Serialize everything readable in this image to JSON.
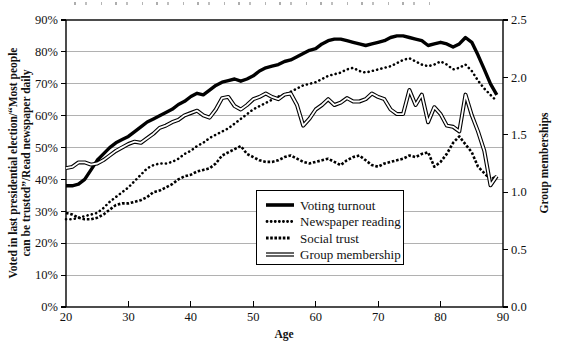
{
  "figure": {
    "x_axis_label": "Age",
    "y_left_axis_label_line1": "Voted in last presidential election/“Most people",
    "y_left_axis_label_line2": "can be trusted”/Read newspaper daily",
    "y_right_axis_label": "Group memberships",
    "colors": {
      "line": "#000000",
      "grid": "#a8a8a8",
      "background": "#ffffff"
    }
  },
  "chart_data": {
    "type": "line",
    "xlabel": "Age",
    "x_range": [
      20,
      90
    ],
    "x_tick_labels": [
      "20",
      "30",
      "40",
      "50",
      "60",
      "70",
      "80",
      "90"
    ],
    "x_tick_values": [
      20,
      30,
      40,
      50,
      60,
      70,
      80,
      90
    ],
    "y_left": {
      "label": "Voted in last presidential election/“Most people can be trusted”/Read newspaper daily",
      "range": [
        0,
        90
      ],
      "tick_labels": [
        "0%",
        "10%",
        "20%",
        "30%",
        "40%",
        "50%",
        "60%",
        "70%",
        "80%",
        "90%"
      ],
      "tick_values": [
        0,
        10,
        20,
        30,
        40,
        50,
        60,
        70,
        80,
        90
      ]
    },
    "y_right": {
      "label": "Group memberships",
      "range": [
        0,
        2.5
      ],
      "tick_labels": [
        "0.0",
        "0.5",
        "1.0",
        "1.5",
        "2.0",
        "2.5"
      ],
      "tick_values": [
        0,
        0.5,
        1,
        1.5,
        2,
        2.5
      ]
    },
    "grid": "horizontal",
    "legend_position": "inside lower-center",
    "ages": [
      20,
      21,
      22,
      23,
      24,
      25,
      26,
      27,
      28,
      29,
      30,
      31,
      32,
      33,
      34,
      35,
      36,
      37,
      38,
      39,
      40,
      41,
      42,
      43,
      44,
      45,
      46,
      47,
      48,
      49,
      50,
      51,
      52,
      53,
      54,
      55,
      56,
      57,
      58,
      59,
      60,
      61,
      62,
      63,
      64,
      65,
      66,
      67,
      68,
      69,
      70,
      71,
      72,
      73,
      74,
      75,
      76,
      77,
      78,
      79,
      80,
      81,
      82,
      83,
      84,
      85,
      86,
      87,
      88,
      89
    ],
    "series": [
      {
        "name": "Voting turnout",
        "axis": "left",
        "unit": "%",
        "style": "solid-thick",
        "values": [
          38,
          38,
          38.5,
          40,
          43,
          46,
          48,
          50,
          51.5,
          52.5,
          53.5,
          55,
          56.5,
          58,
          59,
          60,
          61,
          62,
          63.5,
          64.5,
          66,
          67,
          66.5,
          68,
          69.5,
          70.5,
          71,
          71.5,
          70.8,
          71.5,
          72.5,
          74,
          75,
          75.5,
          76,
          77,
          77.5,
          78.5,
          79.5,
          80.5,
          81,
          82.5,
          83.5,
          84,
          84,
          83.5,
          83,
          82.5,
          82,
          82.5,
          83,
          83.5,
          84.5,
          85,
          85,
          84.5,
          84,
          83.5,
          82,
          82.5,
          83,
          82.5,
          81.5,
          82.5,
          84.5,
          83,
          79,
          74.5,
          70,
          66.5
        ]
      },
      {
        "name": "Newspaper reading",
        "axis": "left",
        "unit": "%",
        "style": "dotted",
        "values": [
          27.5,
          27.5,
          28,
          28.5,
          29,
          29.5,
          31,
          33,
          34.5,
          36,
          37.5,
          39.5,
          41.5,
          43.5,
          44.5,
          45,
          45,
          45.5,
          46.5,
          48,
          49,
          50.5,
          51.5,
          53,
          54,
          55,
          56,
          57.5,
          59,
          60.5,
          62,
          63,
          64,
          65,
          66,
          66.5,
          67.5,
          68.5,
          69.5,
          70,
          70.5,
          71.5,
          72.5,
          73,
          73.5,
          74.5,
          75,
          74,
          73.5,
          74,
          74.5,
          75,
          75.5,
          76.5,
          77.5,
          78,
          77,
          76,
          75.5,
          76,
          77,
          76,
          74.5,
          75,
          76,
          74,
          71,
          68.5,
          66.5,
          64.5
        ]
      },
      {
        "name": "Social trust",
        "axis": "left",
        "unit": "%",
        "style": "dashed",
        "values": [
          29.5,
          29,
          28,
          27.5,
          27.5,
          28,
          29,
          30.5,
          32,
          32.5,
          32.5,
          33,
          33.5,
          34.5,
          36,
          36.5,
          37.5,
          38.5,
          40,
          41,
          41.5,
          42.5,
          43,
          43.5,
          45,
          47.5,
          48.5,
          49.5,
          50.5,
          48,
          47,
          46,
          45.5,
          45.5,
          46,
          47,
          47.5,
          46.5,
          45.5,
          45,
          45.5,
          46,
          46.5,
          45.5,
          44.5,
          46,
          47,
          47.5,
          46,
          44.5,
          44,
          45,
          45.5,
          46,
          46.5,
          47.5,
          47,
          48,
          48.5,
          44,
          45.5,
          48,
          51.5,
          53.5,
          51,
          48.5,
          44,
          42,
          40,
          41
        ]
      },
      {
        "name": "Group membership",
        "axis": "right",
        "unit": "memberships",
        "style": "double-line",
        "values": [
          1.21,
          1.22,
          1.26,
          1.26,
          1.24,
          1.25,
          1.28,
          1.32,
          1.36,
          1.39,
          1.42,
          1.44,
          1.43,
          1.47,
          1.51,
          1.56,
          1.58,
          1.61,
          1.63,
          1.67,
          1.69,
          1.71,
          1.67,
          1.65,
          1.72,
          1.82,
          1.83,
          1.75,
          1.72,
          1.76,
          1.81,
          1.83,
          1.86,
          1.83,
          1.81,
          1.85,
          1.86,
          1.76,
          1.58,
          1.64,
          1.72,
          1.76,
          1.81,
          1.76,
          1.78,
          1.82,
          1.79,
          1.79,
          1.81,
          1.86,
          1.83,
          1.81,
          1.72,
          1.68,
          1.68,
          1.89,
          1.76,
          1.85,
          1.61,
          1.74,
          1.68,
          1.58,
          1.57,
          1.53,
          1.85,
          1.67,
          1.53,
          1.36,
          1.06,
          1.14
        ]
      }
    ]
  }
}
